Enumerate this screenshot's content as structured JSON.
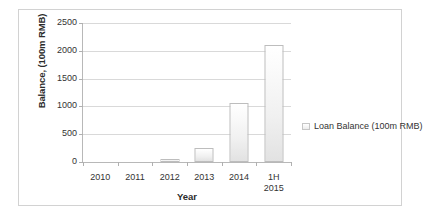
{
  "chart_data": {
    "type": "bar",
    "title": "",
    "xlabel": "Year",
    "ylabel": "Balance, (100m RMB)",
    "categories": [
      "2010",
      "2011",
      "2012",
      "2013",
      "2014",
      "1H\n2015"
    ],
    "values": [
      0,
      0,
      60,
      260,
      1055,
      2100
    ],
    "ylim": [
      0,
      2500
    ],
    "yticks": [
      0,
      500,
      1000,
      1500,
      2000,
      2500
    ],
    "ytick_labels": [
      "0",
      "500",
      "1000",
      "1500",
      "2000",
      "2500"
    ],
    "grid": true,
    "legend_position": "right",
    "series": [
      {
        "name": "Loan Balance (100m RMB)",
        "values": [
          0,
          0,
          60,
          260,
          1055,
          2100
        ]
      }
    ],
    "legend": [
      "Loan Balance (100m RMB)"
    ],
    "colors": {
      "bar_fill_top": "#ffffff",
      "bar_fill_bottom": "#e2e2e2",
      "bar_outline": "#bdbdbd",
      "gridline": "#d9d9d9",
      "axis": "#b8b8b8",
      "text": "#333333",
      "frame_border": "#d2d2d2"
    }
  },
  "legend_entry": {
    "label": "Loan Balance (100m RMB)",
    "marker": "square-swatch-icon"
  }
}
